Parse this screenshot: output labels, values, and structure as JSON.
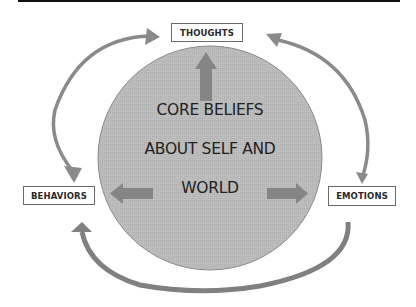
{
  "diagram": {
    "center": {
      "lines": [
        "CORE BELIEFS",
        "ABOUT SELF AND",
        "WORLD"
      ]
    },
    "nodes": {
      "thoughts": "THOUGHTS",
      "behaviors": "BEHAVIORS",
      "emotions": "EMOTIONS"
    },
    "connections": [
      {
        "from": "core_beliefs",
        "to": "thoughts",
        "style": "straight arrow"
      },
      {
        "from": "core_beliefs",
        "to": "behaviors",
        "style": "straight arrow"
      },
      {
        "from": "core_beliefs",
        "to": "emotions",
        "style": "straight arrow"
      },
      {
        "from": "behaviors",
        "to": "thoughts",
        "style": "curved double-headed arrow"
      },
      {
        "from": "emotions",
        "to": "thoughts",
        "style": "curved arrow"
      },
      {
        "from": "emotions",
        "to": "behaviors",
        "style": "curved arrow"
      }
    ],
    "colors": {
      "circle_fill": "#b9b9b9",
      "arrow_fill": "#858585",
      "box_border": "#6a6a6a",
      "text": "#222222"
    }
  }
}
